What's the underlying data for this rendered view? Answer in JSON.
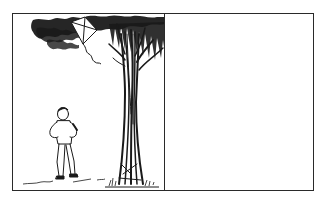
{
  "comic": {
    "panels": [
      {
        "index": 1,
        "scene": "boy-looking-at-kite-in-tree",
        "elements": [
          "tree",
          "kite",
          "boy",
          "ground-line",
          "grass"
        ]
      },
      {
        "index": 2,
        "scene": "empty-panel",
        "elements": []
      }
    ]
  },
  "colors": {
    "ink": "#1a1a1a",
    "paper": "#ffffff",
    "border": "#2a2a2a"
  }
}
